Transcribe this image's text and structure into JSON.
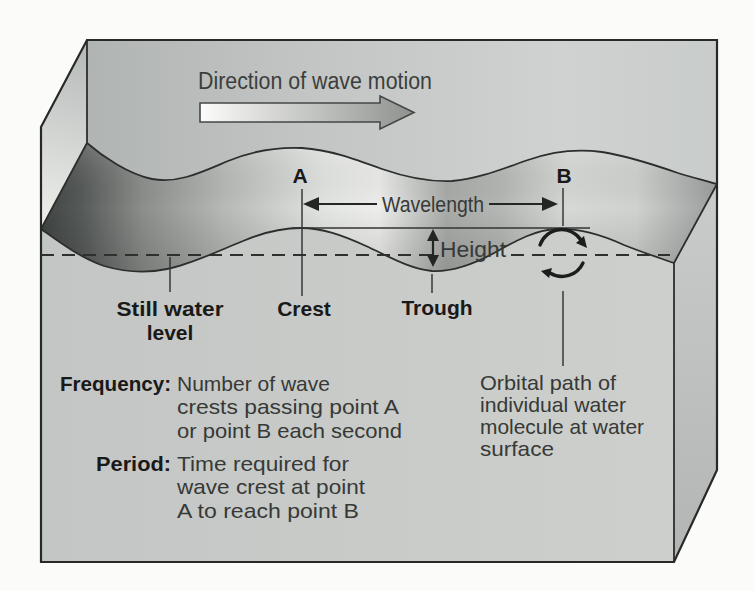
{
  "theme": {
    "paper": "#fbfbf9",
    "ink": "#2c2e2d",
    "label_ink": "#191919",
    "body_ink": "#373937",
    "face_front": "#c6c9c6",
    "face_back": "#c3c7c5",
    "face_side": "#bcc0be",
    "band_dark": "#3f4342",
    "band_light": "#edeeeb"
  },
  "diagram": {
    "direction_label": "Direction of wave motion",
    "point_a": "A",
    "point_b": "B",
    "wavelength_label": "Wavelength",
    "height_label": "Height",
    "still_water_lines": [
      "Still water",
      "level"
    ],
    "crest_label": "Crest",
    "trough_label": "Trough",
    "frequency_term": "Frequency:",
    "frequency_def_lines": [
      "Number of wave",
      "crests passing point A",
      "or point B each second"
    ],
    "period_term": "Period:",
    "period_def_lines": [
      "Time required for",
      "wave crest at point",
      "A to reach point B"
    ],
    "orbital_note_lines": [
      "Orbital path of",
      "individual water",
      "molecule at water",
      "surface"
    ]
  }
}
